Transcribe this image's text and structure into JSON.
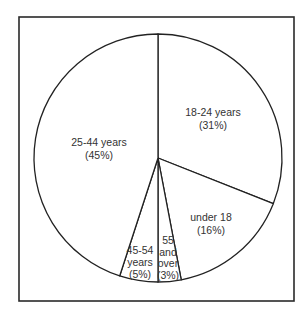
{
  "chart_data": {
    "type": "pie",
    "title": "",
    "categories": [
      "18-24 years",
      "under 18",
      "55 and over",
      "45-54 years",
      "25-44 years"
    ],
    "values": [
      31,
      16,
      3,
      5,
      45
    ],
    "unit": "%",
    "start_angle_deg": 0,
    "direction": "clockwise",
    "legend": "none (labels inside slices)",
    "colors": {
      "fill": "#ffffff",
      "stroke": "#222222",
      "text": "#333333",
      "frame": "#2a2a2a"
    },
    "slices": [
      {
        "name": "18-24 years",
        "value": 31,
        "label_lines": [
          "18-24 years",
          "(31%)"
        ]
      },
      {
        "name": "under 18",
        "value": 16,
        "label_lines": [
          "under 18",
          "(16%)"
        ]
      },
      {
        "name": "55 and over",
        "value": 3,
        "label_lines": [
          "55",
          "and",
          "over",
          "(3%)"
        ]
      },
      {
        "name": "45-54 years",
        "value": 5,
        "label_lines": [
          "45-54",
          "years",
          "(5%)"
        ]
      },
      {
        "name": "25-44 years",
        "value": 45,
        "label_lines": [
          "25-44 years",
          "(45%)"
        ]
      }
    ]
  }
}
